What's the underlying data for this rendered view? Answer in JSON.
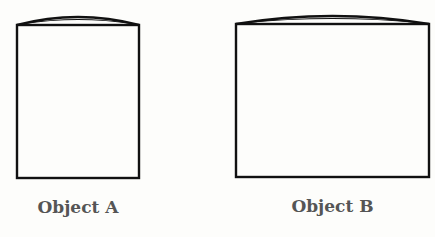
{
  "objects": [
    {
      "label": "Object A",
      "shape": "rectangle-with-bulged-top",
      "box": {
        "left": 17,
        "top": 25,
        "right": 139,
        "bottom": 178
      },
      "arc_peak_y": 17
    },
    {
      "label": "Object B",
      "shape": "rectangle-with-bulged-top",
      "box": {
        "left": 236,
        "top": 24,
        "right": 429,
        "bottom": 177
      },
      "arc_peak_y": 16
    }
  ],
  "colors": {
    "stroke": "#111111",
    "label": "#555555",
    "background": "#fdfdfb"
  }
}
